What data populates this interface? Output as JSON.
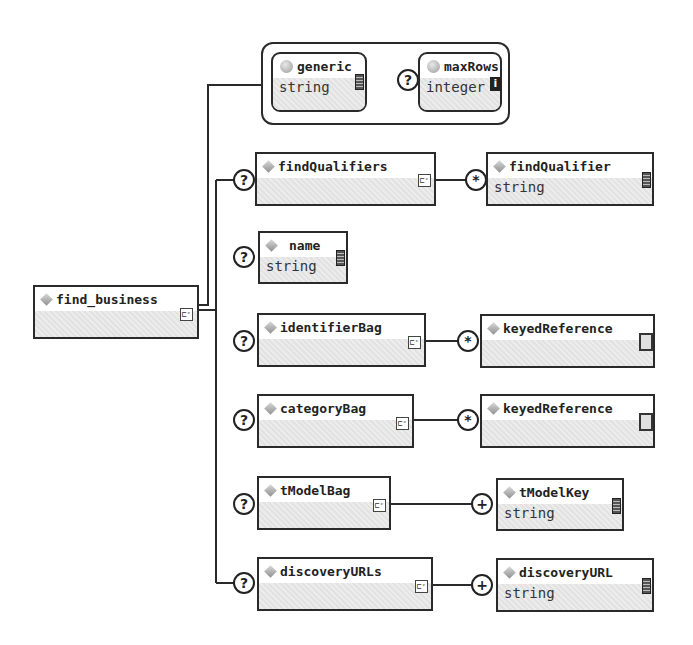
{
  "root": {
    "name": "find_business",
    "icon": "diamond-element-icon",
    "content_icon": "sequence-icon"
  },
  "attributes": {
    "items": [
      {
        "name": "generic",
        "type": "string",
        "optional": false,
        "icon": "attribute-circle-icon",
        "badge": "text-content-icon"
      },
      {
        "name": "maxRows",
        "type": "integer",
        "optional": true,
        "occurrence": "?",
        "icon": "attribute-circle-icon",
        "badge": "info-icon",
        "badge_glyph": "i"
      }
    ]
  },
  "children": [
    {
      "name": "findQualifiers",
      "occurrence": "?",
      "has_children": true,
      "child": {
        "name": "findQualifier",
        "type": "string",
        "occurrence": "*"
      }
    },
    {
      "name": "name",
      "type": "string",
      "occurrence": "?",
      "has_children": false
    },
    {
      "name": "identifierBag",
      "occurrence": "?",
      "has_children": true,
      "child": {
        "name": "keyedReference",
        "occurrence": "*"
      }
    },
    {
      "name": "categoryBag",
      "occurrence": "?",
      "has_children": true,
      "child": {
        "name": "keyedReference",
        "occurrence": "*"
      }
    },
    {
      "name": "tModelBag",
      "occurrence": "?",
      "has_children": true,
      "child": {
        "name": "tModelKey",
        "type": "string",
        "occurrence": "+"
      }
    },
    {
      "name": "discoveryURLs",
      "occurrence": "?",
      "has_children": true,
      "child": {
        "name": "discoveryURL",
        "type": "string",
        "occurrence": "+"
      }
    }
  ],
  "glyphs": {
    "sequence": "⊏ᶜ"
  },
  "colors": {
    "stroke": "#2a2a2a",
    "hatch": "#e4e4e4",
    "background": "#ffffff"
  }
}
